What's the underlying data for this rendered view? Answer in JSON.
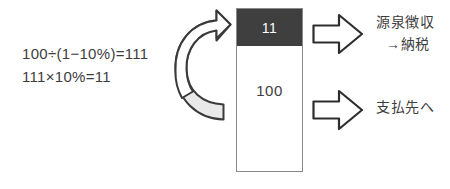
{
  "diagram": {
    "formula": {
      "lines": [
        "100÷(1−10%)=111",
        "111×10%=11"
      ]
    },
    "amount_box": {
      "segments": [
        {
          "name": "withholding",
          "value": "11",
          "fill": "#3f3f3f",
          "text_color": "#ffffff"
        },
        {
          "name": "payment",
          "value": "100",
          "fill": "#ffffff",
          "text_color": "#3d3d3d"
        }
      ]
    },
    "flows": [
      {
        "name": "withholding-flow",
        "arrow_icon": "block-arrow-right-icon",
        "label_line1": "源泉徴収",
        "label_line2": "→納税"
      },
      {
        "name": "payment-flow",
        "arrow_icon": "block-arrow-right-icon",
        "label_line1": "支払先へ",
        "label_line2": ""
      }
    ],
    "gross_up_arrow": {
      "name": "curved-gross-up-arrow-icon",
      "outline_color": "#3a3a3a",
      "fill_color": "#e2e2e2"
    },
    "colors": {
      "stroke": "#3a3a3a",
      "box_border": "#8a8a8a",
      "dark_segment": "#3f3f3f",
      "background": "#ffffff"
    }
  }
}
